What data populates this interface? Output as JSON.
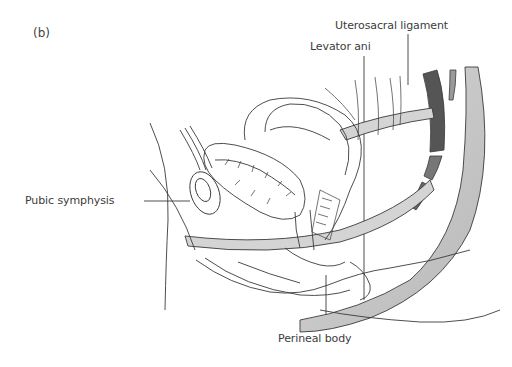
{
  "figure": {
    "panel_label": "(b)",
    "labels": {
      "uterosacral_ligament": "Uterosacral ligament",
      "levator_ani": "Levator ani",
      "pubic_symphysis": "Pubic symphysis",
      "perineal_body": "Perineal body"
    },
    "colors": {
      "line": "#3a3a3a",
      "shade": "#bdbdbd",
      "dark_fill": "#4a4a4a",
      "background": "#ffffff"
    }
  }
}
